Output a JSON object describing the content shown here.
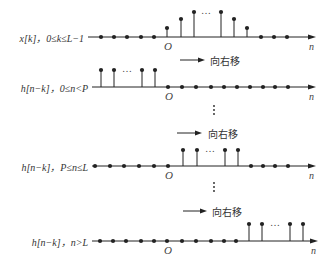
{
  "figure": {
    "shift_label": "向右移",
    "origin_label": "O",
    "axis_label": "n",
    "ellipsis": "…",
    "colors": {
      "ink": "#222222",
      "text": "#333333",
      "background": "#ffffff"
    }
  },
  "plots": [
    {
      "id": "x",
      "label": "x[k]，0≤k≤L−1",
      "axis_y": 37,
      "axis_x0": 88,
      "axis_x1": 316,
      "origin_x": 167,
      "dots": [
        101,
        114,
        127,
        141,
        154,
        261,
        274,
        287
      ],
      "stems": [
        {
          "x": 167,
          "top": 28
        },
        {
          "x": 181,
          "top": 19
        },
        {
          "x": 194,
          "top": 12
        },
        {
          "x": 221,
          "top": 12
        },
        {
          "x": 234,
          "top": 19
        },
        {
          "x": 247,
          "top": 28
        }
      ],
      "ellipsis_x": 207,
      "ellipsis_y": 13
    },
    {
      "id": "h1",
      "label": "h[n−k]，0≤n<P",
      "axis_y": 87,
      "axis_x0": 92,
      "axis_x1": 316,
      "origin_x": 168,
      "dots": [
        168,
        182,
        196,
        211,
        224,
        237,
        250,
        263,
        275,
        288
      ],
      "stems": [
        {
          "x": 101,
          "top": 70
        },
        {
          "x": 114,
          "top": 70
        },
        {
          "x": 142,
          "top": 70
        },
        {
          "x": 155,
          "top": 70
        }
      ],
      "ellipsis_x": 128,
      "ellipsis_y": 71
    },
    {
      "id": "h2",
      "label": "h[n−k]，P≤n≤L",
      "axis_y": 166,
      "axis_x0": 92,
      "axis_x1": 316,
      "origin_x": 168,
      "dots": [
        95,
        110,
        124,
        139,
        154,
        168,
        251,
        263,
        275,
        288
      ],
      "stems": [
        {
          "x": 183,
          "top": 150
        },
        {
          "x": 197,
          "top": 150
        },
        {
          "x": 225,
          "top": 150
        },
        {
          "x": 238,
          "top": 150
        }
      ],
      "ellipsis_x": 211,
      "ellipsis_y": 151
    },
    {
      "id": "h3",
      "label": "h[n−k]，n>L",
      "axis_y": 241,
      "axis_x0": 92,
      "axis_x1": 318,
      "origin_x": 167,
      "dots": [
        100,
        113,
        126,
        141,
        154,
        167,
        182,
        196,
        211,
        224,
        236
      ],
      "stems": [
        {
          "x": 249,
          "top": 224
        },
        {
          "x": 262,
          "top": 224
        },
        {
          "x": 290,
          "top": 224
        },
        {
          "x": 303,
          "top": 224
        }
      ],
      "ellipsis_x": 276,
      "ellipsis_y": 225
    }
  ],
  "shift_arrows": [
    {
      "x0": 180,
      "x1": 205,
      "y": 60,
      "text_x": 210
    },
    {
      "x0": 177,
      "x1": 202,
      "y": 133,
      "text_x": 208
    },
    {
      "x0": 183,
      "x1": 207,
      "y": 211,
      "text_x": 212
    }
  ],
  "vertical_ellipses": [
    {
      "x": 214,
      "y": 106
    },
    {
      "x": 214,
      "y": 183
    }
  ]
}
